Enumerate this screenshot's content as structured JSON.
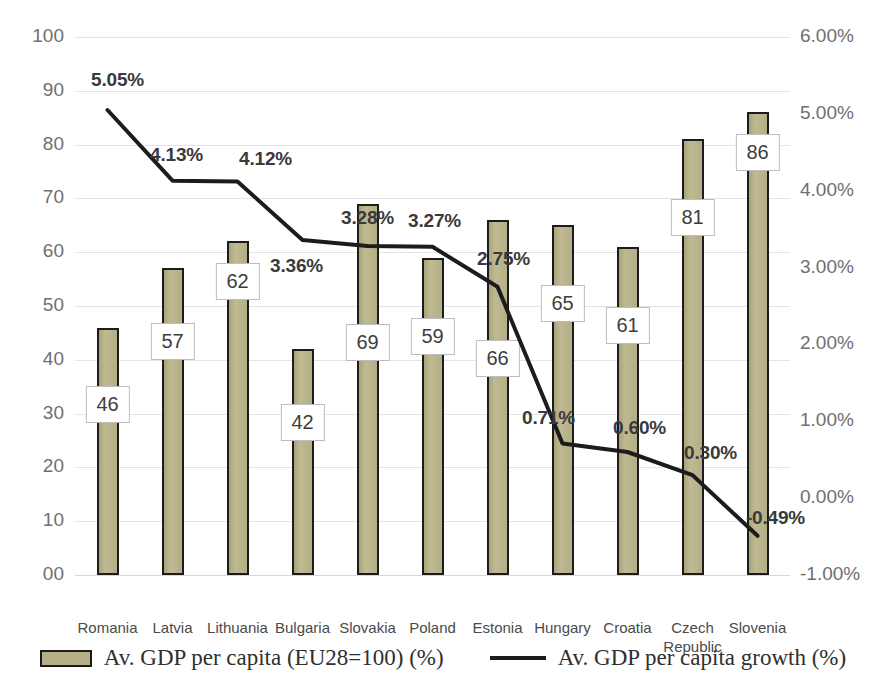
{
  "chart_data": {
    "type": "bar",
    "title": "",
    "subtitle": "",
    "xlabel": "",
    "ylabel": "",
    "grid": true,
    "legend_position": "bottom",
    "categories": [
      "Romania",
      "Latvia",
      "Lithuania",
      "Bulgaria",
      "Slovakia",
      "Poland",
      "Estonia",
      "Hungary",
      "Croatia",
      "Czech Republic",
      "Slovenia"
    ],
    "category_display": [
      "Romania",
      "Latvia",
      "Lithuania",
      "Bulgaria",
      "Slovakia",
      "Poland",
      "Estonia",
      "Hungary",
      "Croatia",
      "Czech\nRepublic",
      "Slovenia"
    ],
    "series": [
      {
        "name": "Av. GDP per capita (EU28=100) (%)",
        "type": "bar",
        "axis": "left",
        "color": "#b5af85",
        "values": [
          46,
          57,
          62,
          42,
          69,
          59,
          66,
          65,
          61,
          81,
          86
        ],
        "value_labels": [
          "46",
          "57",
          "62",
          "42",
          "69",
          "59",
          "66",
          "65",
          "61",
          "81",
          "86"
        ]
      },
      {
        "name": "Av. GDP per capita growth (%)",
        "type": "line",
        "axis": "right",
        "color": "#1c1c1c",
        "values": [
          5.05,
          4.13,
          4.12,
          3.36,
          3.28,
          3.27,
          2.75,
          0.71,
          0.6,
          0.3,
          -0.49
        ],
        "value_labels": [
          "5.05%",
          "4.13%",
          "4.12%",
          "3.36%",
          "3.28%",
          "3.27%",
          "2.75%",
          "0.71%",
          "0.60%",
          "0.30%",
          "-0.49%"
        ]
      }
    ],
    "left_axis": {
      "min": 0,
      "max": 100,
      "step": 10,
      "ticks": [
        "100",
        "90",
        "80",
        "70",
        "60",
        "50",
        "40",
        "30",
        "20",
        "10",
        "00"
      ]
    },
    "right_axis": {
      "min": -1.0,
      "max": 6.0,
      "step": 1.0,
      "ticks": [
        "6.00%",
        "5.00%",
        "4.00%",
        "3.00%",
        "2.00%",
        "1.00%",
        "0.00%",
        "-1.00%"
      ]
    },
    "legend": [
      {
        "label": "Av. GDP per capita (EU28=100) (%)",
        "marker": "bar-swatch"
      },
      {
        "label": "Av. GDP per capita growth (%)",
        "marker": "line-swatch"
      }
    ]
  }
}
